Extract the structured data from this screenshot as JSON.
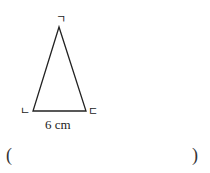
{
  "figure": {
    "vertices": [
      {
        "name": "top",
        "label": "ㄱ"
      },
      {
        "name": "bottom-left",
        "label": "ㄴ"
      },
      {
        "name": "bottom-right",
        "label": "ㄷ"
      }
    ],
    "base_length_label": "6 cm"
  },
  "answer": {
    "open_paren": "(",
    "close_paren": ")",
    "value": ""
  }
}
